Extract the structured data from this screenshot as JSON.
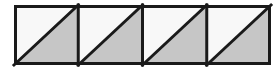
{
  "figure": {
    "caption": "",
    "background_color": "#ffffff"
  },
  "geometry": {
    "canvas_width": 277,
    "canvas_height": 74,
    "outer_rect": {
      "x": 14,
      "y": 5,
      "width": 257,
      "height": 60
    },
    "cell_count": 4,
    "cell_width": 64.25,
    "cell_height": 60,
    "divider_x_positions": [
      78.25,
      142.5,
      206.75
    ],
    "diagonal_direction": "bottom-left-to-top-right",
    "shaded_half": "lower-right"
  },
  "style": {
    "stroke_color": "#1a1a1a",
    "outer_stroke_width": 3,
    "divider_stroke_width": 3,
    "diagonal_stroke_width": 3,
    "shaded_fill": "#c6c6c6",
    "unshaded_fill": "#f8f8f8"
  },
  "cells": [
    {
      "index": 1,
      "name": "square-1",
      "x": 14,
      "width": 64.25,
      "upper_triangle_fill": "#f8f8f8",
      "lower_triangle_fill": "#c6c6c6",
      "label": ""
    },
    {
      "index": 2,
      "name": "square-2",
      "x": 78.25,
      "width": 64.25,
      "upper_triangle_fill": "#f8f8f8",
      "lower_triangle_fill": "#c6c6c6",
      "label": ""
    },
    {
      "index": 3,
      "name": "square-3",
      "x": 142.5,
      "width": 64.25,
      "upper_triangle_fill": "#f8f8f8",
      "lower_triangle_fill": "#c6c6c6",
      "label": ""
    },
    {
      "index": 4,
      "name": "square-4",
      "x": 206.75,
      "width": 64.25,
      "upper_triangle_fill": "#f8f8f8",
      "lower_triangle_fill": "#c6c6c6",
      "label": ""
    }
  ]
}
